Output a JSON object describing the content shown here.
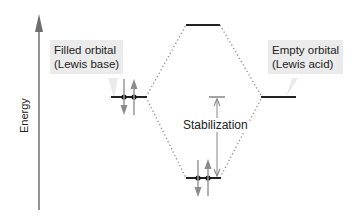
{
  "diagram": {
    "axis": {
      "label": "Energy",
      "direction": "up"
    },
    "callouts": {
      "left": {
        "line1": "Filled orbital",
        "line2": "(Lewis base)"
      },
      "right": {
        "line1": "Empty orbital",
        "line2": "(Lewis acid)"
      }
    },
    "levels": [
      {
        "name": "Lewis base filled orbital",
        "electrons": 2
      },
      {
        "name": "Antibonding orbital",
        "electrons": 0
      },
      {
        "name": "Lewis acid empty orbital",
        "electrons": 0
      },
      {
        "name": "Bonding orbital",
        "electrons": 2
      }
    ],
    "stabilization_label": "Stabilization",
    "colors": {
      "line": "#222222",
      "arrow": "#8c8c8c",
      "axis": "#7a7a7a",
      "callout_bg": "#ebebeb"
    }
  }
}
